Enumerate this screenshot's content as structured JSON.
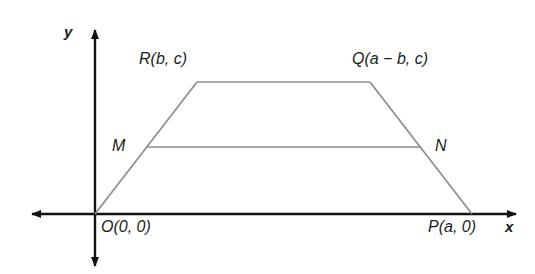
{
  "figure": {
    "type": "coordinate-geometry-diagram",
    "colors": {
      "axis": "#111111",
      "shape": "#8d8d8d",
      "text": "#1c1c1c",
      "background": "#ffffff"
    },
    "axes": {
      "x_label": "x",
      "y_label": "y",
      "origin_px": {
        "x": 95,
        "y": 214
      }
    },
    "labels": {
      "origin": "O(0, 0)",
      "p": "P(a, 0)",
      "q": "Q(a − b, c)",
      "r": "R(b, c)",
      "m": "M",
      "n": "N"
    },
    "vertices": [
      {
        "name": "O",
        "label": "O(0, 0)",
        "coords": "(0, 0)",
        "px": {
          "x": 95,
          "y": 214
        }
      },
      {
        "name": "P",
        "label": "P(a, 0)",
        "coords": "(a, 0)",
        "px": {
          "x": 472,
          "y": 214
        }
      },
      {
        "name": "Q",
        "label": "Q(a − b, c)",
        "coords": "(a − b, c)",
        "px": {
          "x": 370,
          "y": 82
        }
      },
      {
        "name": "R",
        "label": "R(b, c)",
        "coords": "(b, c)",
        "px": {
          "x": 197,
          "y": 82
        }
      },
      {
        "name": "M",
        "label": "M",
        "coords": "midpoint of OR",
        "px": {
          "x": 147,
          "y": 147
        }
      },
      {
        "name": "N",
        "label": "N",
        "coords": "midpoint of PQ",
        "px": {
          "x": 421,
          "y": 147
        }
      }
    ],
    "segments": [
      {
        "name": "OR",
        "from": "O",
        "to": "R"
      },
      {
        "name": "RQ",
        "from": "R",
        "to": "Q"
      },
      {
        "name": "QP",
        "from": "Q",
        "to": "P"
      },
      {
        "name": "MN",
        "from": "M",
        "to": "N"
      }
    ]
  }
}
